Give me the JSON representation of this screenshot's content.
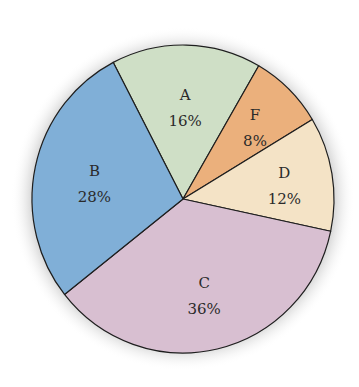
{
  "chart_data": {
    "type": "pie",
    "title": "",
    "categories": [
      "A",
      "F",
      "D",
      "C",
      "B"
    ],
    "values": [
      16,
      8,
      12,
      36,
      28
    ],
    "unit": "%",
    "slices": [
      {
        "label": "A",
        "value": 16,
        "display": "16%",
        "color": "#cfdfc6"
      },
      {
        "label": "F",
        "value": 8,
        "display": "8%",
        "color": "#ebb07c"
      },
      {
        "label": "D",
        "value": 12,
        "display": "12%",
        "color": "#f4e3c6"
      },
      {
        "label": "C",
        "value": 36,
        "display": "36%",
        "color": "#d8bfd1"
      },
      {
        "label": "B",
        "value": 28,
        "display": "28%",
        "color": "#80afd7"
      }
    ],
    "legend": "none"
  }
}
